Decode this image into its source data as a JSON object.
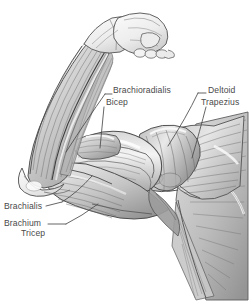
{
  "figure": {
    "medium": "pencil sketch",
    "background_color": "#ffffff",
    "ink_color": "#4a4a4a",
    "shading_color": "#8c8c8c",
    "highlight_color": "#f2f2f2"
  },
  "labels": [
    {
      "id": "brachioradialis",
      "text": "Brachioradialis",
      "x": 113,
      "y": 90,
      "align": "left"
    },
    {
      "id": "bicep",
      "text": "Bicep",
      "x": 106,
      "y": 102,
      "align": "left"
    },
    {
      "id": "deltoid",
      "text": "Deltoid",
      "x": 208,
      "y": 90,
      "align": "left"
    },
    {
      "id": "trapezius",
      "text": "Trapezius",
      "x": 201,
      "y": 102,
      "align": "left"
    },
    {
      "id": "brachialis",
      "text": "Brachialis",
      "x": 4,
      "y": 206,
      "align": "left"
    },
    {
      "id": "brachium",
      "text": "Brachium",
      "x": 4,
      "y": 222,
      "align": "left"
    },
    {
      "id": "tricep",
      "text": "Tricep",
      "x": 21,
      "y": 232,
      "align": "left"
    }
  ],
  "leader_lines": [
    {
      "id": "brachioradialis-leader",
      "from": "label Brachioradialis",
      "to": "forearm flexor mass"
    },
    {
      "id": "bicep-leader",
      "from": "label Bicep",
      "to": "biceps brachii belly"
    },
    {
      "id": "deltoid-leader",
      "from": "label Deltoid",
      "to": "deltoid muscle"
    },
    {
      "id": "trapezius-leader",
      "from": "label Trapezius",
      "to": "trapezius muscle"
    },
    {
      "id": "brachialis-leader",
      "from": "label Brachialis",
      "to": "brachialis muscle"
    },
    {
      "id": "brachium-tricep-leader",
      "from": "label Brachium Tricep",
      "to": "triceps brachii"
    }
  ],
  "anatomy_parts": [
    {
      "id": "fist",
      "name": "clenched fist"
    },
    {
      "id": "forearm",
      "name": "forearm"
    },
    {
      "id": "bicep",
      "name": "biceps brachii"
    },
    {
      "id": "brachialis",
      "name": "brachialis"
    },
    {
      "id": "tricep",
      "name": "triceps brachii"
    },
    {
      "id": "deltoid",
      "name": "deltoid"
    },
    {
      "id": "trapezius",
      "name": "trapezius"
    },
    {
      "id": "torso",
      "name": "upper torso / scapular region"
    }
  ]
}
